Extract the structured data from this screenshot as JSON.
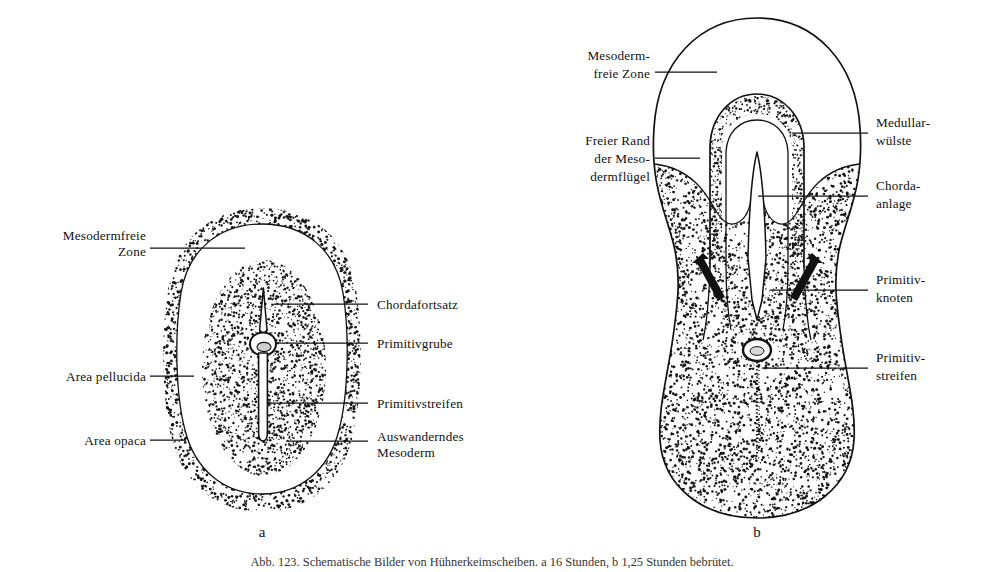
{
  "figure": {
    "panels": [
      {
        "id": "a",
        "letter": "a",
        "labels_left": [
          {
            "name": "mesodermfreie-zone",
            "lines": [
              "Mesodermfreie",
              "Zone"
            ],
            "align": "right"
          },
          {
            "name": "area-pellucida",
            "lines": [
              "Area pellucida"
            ],
            "align": "right"
          },
          {
            "name": "area-opaca",
            "lines": [
              "Area opaca"
            ],
            "align": "right"
          }
        ],
        "labels_right": [
          {
            "name": "chordafortsatz",
            "lines": [
              "Chordafortsatz"
            ],
            "align": "left"
          },
          {
            "name": "primitivgrube",
            "lines": [
              "Primitivgrube"
            ],
            "align": "left"
          },
          {
            "name": "primitivstreifen",
            "lines": [
              "Primitivstreifen"
            ],
            "align": "left"
          },
          {
            "name": "auswanderndes-mesoderm",
            "lines": [
              "Auswanderndes",
              "Mesoderm"
            ],
            "align": "left"
          }
        ]
      },
      {
        "id": "b",
        "letter": "b",
        "labels_left": [
          {
            "name": "mesodermfreie-zone",
            "lines": [
              "Mesoderm-",
              "freie Zone"
            ],
            "align": "right"
          },
          {
            "name": "freier-rand-der-mesodermfluegel",
            "lines": [
              "Freier Rand",
              "der Meso-",
              "dermflügel"
            ],
            "align": "right"
          }
        ],
        "labels_right": [
          {
            "name": "medullarwuelste",
            "lines": [
              "Medullar-",
              "wülste"
            ],
            "align": "left"
          },
          {
            "name": "chordaanlage",
            "lines": [
              "Chorda-",
              "anlage"
            ],
            "align": "left"
          },
          {
            "name": "primitivknoten",
            "lines": [
              "Primitiv-",
              "knoten"
            ],
            "align": "left"
          },
          {
            "name": "primitivstreifen",
            "lines": [
              "Primitiv-",
              "streifen"
            ],
            "align": "left"
          }
        ]
      }
    ],
    "caption": "Abb. 123. Schematische Bilder von Hühnerkeimscheiben. a 16 Stunden, b 1,25 Stunden bebrütet.",
    "colors": {
      "ink": "#111111",
      "stipple": "#1a1a1a",
      "background": "#ffffff"
    }
  },
  "panel_a_text": {
    "l0_0": "Mesodermfreie",
    "l0_1": "Zone",
    "l1_0": "Area pellucida",
    "l2_0": "Area opaca",
    "r0_0": "Chordafortsatz",
    "r1_0": "Primitivgrube",
    "r2_0": "Primitivstreifen",
    "r3_0": "Auswanderndes",
    "r3_1": "Mesoderm",
    "letter": "a"
  },
  "panel_b_text": {
    "l0_0": "Mesoderm-",
    "l0_1": "freie Zone",
    "l1_0": "Freier Rand",
    "l1_1": "der Meso-",
    "l1_2": "dermflügel",
    "r0_0": "Medullar-",
    "r0_1": "wülste",
    "r1_0": "Chorda-",
    "r1_1": "anlage",
    "r2_0": "Primitiv-",
    "r2_1": "knoten",
    "r3_0": "Primitiv-",
    "r3_1": "streifen",
    "letter": "b"
  }
}
